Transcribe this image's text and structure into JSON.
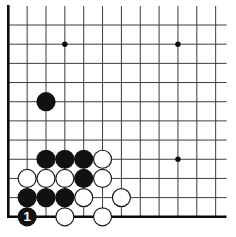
{
  "diagram": {
    "type": "go-board-corner-diagram",
    "background_color": "#ffffff",
    "line_color": "#3d3d3d",
    "edge_color": "#0a0a0a",
    "stone_black_color": "#111111",
    "stone_white_fill": "#ffffff",
    "stone_white_outline": "#1a1a1a",
    "move_label_color": "#ffffff",
    "board": {
      "visible_cols": 12,
      "visible_rows": 11,
      "col0_x": 8.3,
      "row0_y": 25.0,
      "cell_w": 18.85,
      "cell_h": 19.18,
      "top_crop_y": 6,
      "right_crop_x": 226.5,
      "thick_left_col": 0,
      "thick_bottom_row": 10,
      "thin_line_width": 1,
      "edge_line_width": 2.6,
      "star_radius": 2.7,
      "stone_radius": 9.6,
      "label_font_size": 13
    },
    "star_points": [
      {
        "col": 3,
        "row": 1
      },
      {
        "col": 9,
        "row": 1
      },
      {
        "col": 9,
        "row": 7
      }
    ],
    "stones": [
      {
        "col": 2,
        "row": 4,
        "color": "black"
      },
      {
        "col": 2,
        "row": 7,
        "color": "black"
      },
      {
        "col": 3,
        "row": 7,
        "color": "black"
      },
      {
        "col": 4,
        "row": 7,
        "color": "black"
      },
      {
        "col": 5,
        "row": 7,
        "color": "white"
      },
      {
        "col": 1,
        "row": 8,
        "color": "white"
      },
      {
        "col": 2,
        "row": 8,
        "color": "white"
      },
      {
        "col": 3,
        "row": 8,
        "color": "white"
      },
      {
        "col": 4,
        "row": 8,
        "color": "black"
      },
      {
        "col": 5,
        "row": 8,
        "color": "white"
      },
      {
        "col": 1,
        "row": 9,
        "color": "black"
      },
      {
        "col": 2,
        "row": 9,
        "color": "black"
      },
      {
        "col": 3,
        "row": 9,
        "color": "black"
      },
      {
        "col": 4,
        "row": 9,
        "color": "white"
      },
      {
        "col": 6,
        "row": 9,
        "color": "white"
      },
      {
        "col": 1,
        "row": 10,
        "color": "black",
        "label": "1"
      },
      {
        "col": 3,
        "row": 10,
        "color": "white"
      },
      {
        "col": 5,
        "row": 10,
        "color": "white"
      }
    ]
  }
}
